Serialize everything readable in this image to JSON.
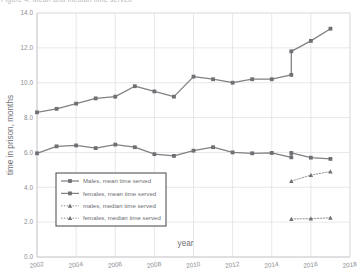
{
  "top_cut_text": "Figure 4. Mean and median time served",
  "chart_data": {
    "type": "line",
    "title": "",
    "xlabel": "year",
    "ylabel": "time in prison, months",
    "xlim": [
      2002,
      2018
    ],
    "ylim": [
      0.0,
      14.0
    ],
    "xticks": [
      "2002",
      "2004",
      "2006",
      "2008",
      "2010",
      "2012",
      "2014",
      "2016",
      "2018"
    ],
    "yticks": [
      "0.0",
      "2.0",
      "4.0",
      "6.0",
      "8.0",
      "10.0",
      "12.0",
      "14.0"
    ],
    "grid": true,
    "legend_position": "lower-left",
    "x": [
      2002,
      2003,
      2004,
      2005,
      2006,
      2007,
      2008,
      2009,
      2010,
      2011,
      2012,
      2013,
      2014,
      2015,
      2016,
      2017
    ],
    "series": [
      {
        "name": "Males, mean time served",
        "style": "solid",
        "marker": "square",
        "color": "#808085",
        "values": [
          8.3,
          8.5,
          8.8,
          9.1,
          9.2,
          9.8,
          9.5,
          9.2,
          10.35,
          10.2,
          10.0,
          10.2,
          10.2,
          10.45,
          12.4,
          13.1
        ],
        "break_note": "vertical jump at 2015 from 10.45 to 11.8",
        "break_year": 2015,
        "break_low": 10.45,
        "break_high": 11.8
      },
      {
        "name": "females, mean time served",
        "style": "solid",
        "marker": "square",
        "color": "#808085",
        "values": [
          5.95,
          6.35,
          6.4,
          6.25,
          6.45,
          6.3,
          5.9,
          5.8,
          6.1,
          6.3,
          6.0,
          5.95,
          5.97,
          5.72,
          5.7,
          5.63
        ],
        "break_note": "vertical drop at 2015 from 5.97 to 5.72",
        "break_year": 2015,
        "break_low": 5.72,
        "break_high": 5.97
      },
      {
        "name": "males, median time served",
        "style": "dotted",
        "marker": "triangle",
        "color": "#8a8a8f",
        "x": [
          2015,
          2016,
          2017
        ],
        "values": [
          4.35,
          4.7,
          4.9
        ]
      },
      {
        "name": "females, median time served",
        "style": "dotted",
        "marker": "triangle",
        "color": "#8a8a8f",
        "x": [
          2015,
          2016,
          2017
        ],
        "values": [
          2.18,
          2.2,
          2.25
        ]
      }
    ]
  },
  "legend": {
    "items": [
      {
        "label": "Males, mean time served",
        "style": "solid",
        "marker": "square"
      },
      {
        "label": "females, mean time served",
        "style": "solid",
        "marker": "square"
      },
      {
        "label": "males, median time served",
        "style": "dotted",
        "marker": "triangle"
      },
      {
        "label": "females, median time served",
        "style": "dotted",
        "marker": "triangle"
      }
    ]
  },
  "colors": {
    "line": "#808085",
    "marker": "#6f6f74",
    "grid": "#dcdce0",
    "axis": "#c8c8cc",
    "text": "#8d8d92",
    "legend_border": "#55555a",
    "background": "#ffffff"
  }
}
